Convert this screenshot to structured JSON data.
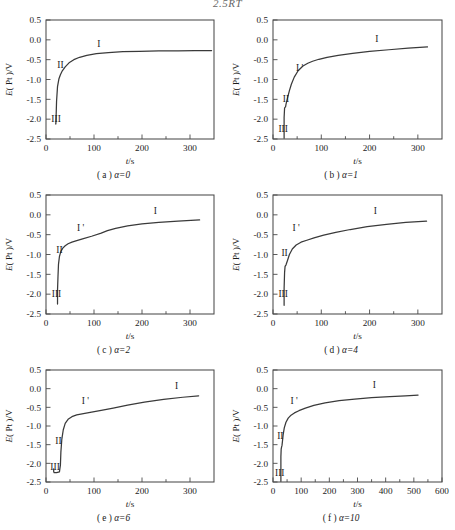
{
  "header_fragment": "2.5RT",
  "figure": {
    "y_axis_label_main": "E",
    "y_axis_label_paren": "( Pt )/V",
    "x_axis_label_main": "t",
    "x_axis_label_unit": "/s",
    "y_ticks": [
      "0.5",
      "0.0",
      "-0.5",
      "-1.0",
      "-1.5",
      "-2.0",
      "-2.5"
    ],
    "y_tick_values": [
      0.5,
      0.0,
      -0.5,
      -1.0,
      -1.5,
      -2.0,
      -2.5
    ],
    "ylim": [
      -2.5,
      0.5
    ],
    "region_labels": [
      "I",
      "I '",
      "II",
      "III"
    ],
    "curve_color": "#3a3a3a",
    "axis_color": "#4a4a4a"
  },
  "panels": [
    {
      "key": "a",
      "caption_index": "( a )",
      "caption_alpha": "α=0",
      "alpha": 0,
      "x_ticks": [
        "0",
        "100",
        "200",
        "300"
      ],
      "x_tick_values": [
        0,
        100,
        200,
        300
      ],
      "xlim": [
        0,
        350
      ],
      "x_minor_step": 50,
      "regions_shown": [
        "I",
        "II",
        "III"
      ],
      "region_positions": {
        "I": {
          "t": 110,
          "e": -0.18
        },
        "II": {
          "t": 30,
          "e": -0.72
        },
        "III": {
          "t": 21,
          "e": -2.08
        }
      },
      "chart_data": {
        "type": "line",
        "title": "( a ) α=0",
        "xlabel": "t/s",
        "ylabel": "E ( Pt )/V",
        "xlim": [
          0,
          350
        ],
        "ylim": [
          -2.5,
          0.5
        ],
        "grid": false,
        "series": [
          {
            "name": "E(Pt)",
            "x": [
              20,
              20.5,
              21,
              22,
              24,
              27,
              30,
              34,
              40,
              48,
              58,
              70,
              85,
              105,
              130,
              160,
              195,
              235,
              275,
              310,
              345
            ],
            "y": [
              -2.12,
              -2.12,
              -1.95,
              -1.55,
              -1.18,
              -0.98,
              -0.88,
              -0.78,
              -0.68,
              -0.58,
              -0.5,
              -0.44,
              -0.39,
              -0.35,
              -0.32,
              -0.3,
              -0.29,
              -0.28,
              -0.28,
              -0.27,
              -0.27
            ]
          }
        ]
      }
    },
    {
      "key": "b",
      "caption_index": "( b )",
      "caption_alpha": "α=1",
      "alpha": 1,
      "x_ticks": [
        "0",
        "100",
        "200",
        "300"
      ],
      "x_tick_values": [
        0,
        100,
        200,
        300
      ],
      "xlim": [
        0,
        350
      ],
      "x_minor_step": 50,
      "regions_shown": [
        "I",
        "I '",
        "II",
        "III"
      ],
      "region_positions": {
        "I": {
          "t": 215,
          "e": -0.06
        },
        "I '": {
          "t": 55,
          "e": -0.78
        },
        "II": {
          "t": 27,
          "e": -1.56
        },
        "III": {
          "t": 21,
          "e": -2.32
        }
      },
      "chart_data": {
        "type": "line",
        "title": "( b ) α=1",
        "xlabel": "t/s",
        "ylabel": "E ( Pt )/V",
        "xlim": [
          0,
          350
        ],
        "ylim": [
          -2.5,
          0.5
        ],
        "grid": false,
        "series": [
          {
            "name": "E(Pt)",
            "x": [
              23,
              23,
              24,
              25,
              26,
              27,
              29,
              31,
              34,
              38,
              44,
              52,
              62,
              72,
              82,
              95,
              112,
              135,
              165,
              200,
              240,
              280,
              320
            ],
            "y": [
              -2.48,
              -1.96,
              -1.72,
              -1.7,
              -1.69,
              -1.62,
              -1.52,
              -1.42,
              -1.28,
              -1.12,
              -0.94,
              -0.78,
              -0.66,
              -0.59,
              -0.54,
              -0.49,
              -0.44,
              -0.39,
              -0.34,
              -0.29,
              -0.25,
              -0.21,
              -0.18
            ]
          }
        ]
      }
    },
    {
      "key": "c",
      "caption_index": "( c )",
      "caption_alpha": "α=2",
      "alpha": 2,
      "x_ticks": [
        "0",
        "100",
        "200",
        "300"
      ],
      "x_tick_values": [
        0,
        100,
        200,
        300
      ],
      "xlim": [
        0,
        350
      ],
      "x_minor_step": 50,
      "regions_shown": [
        "I",
        "I '",
        "II",
        "III"
      ],
      "region_positions": {
        "I": {
          "t": 228,
          "e": 0.02
        },
        "I '": {
          "t": 72,
          "e": -0.42
        },
        "II": {
          "t": 28,
          "e": -0.95
        },
        "III": {
          "t": 22,
          "e": -2.08
        }
      },
      "chart_data": {
        "type": "line",
        "title": "( c ) α=2",
        "xlabel": "t/s",
        "ylabel": "E ( Pt )/V",
        "xlim": [
          0,
          350
        ],
        "ylim": [
          -2.5,
          0.5
        ],
        "grid": false,
        "series": [
          {
            "name": "E(Pt)",
            "x": [
              24,
              24,
              25,
              26,
              28,
              31,
              35,
              40,
              46,
              54,
              64,
              78,
              95,
              115,
              128,
              145,
              170,
              200,
              235,
              275,
              320
            ],
            "y": [
              -2.25,
              -1.9,
              -1.55,
              -1.25,
              -1.05,
              -0.92,
              -0.84,
              -0.78,
              -0.73,
              -0.69,
              -0.65,
              -0.6,
              -0.54,
              -0.46,
              -0.4,
              -0.34,
              -0.28,
              -0.23,
              -0.19,
              -0.16,
              -0.13
            ]
          }
        ]
      }
    },
    {
      "key": "d",
      "caption_index": "( d )",
      "caption_alpha": "α=4",
      "alpha": 4,
      "x_ticks": [
        "0",
        "100",
        "200",
        "300"
      ],
      "x_tick_values": [
        0,
        100,
        200,
        300
      ],
      "xlim": [
        0,
        350
      ],
      "x_minor_step": 50,
      "regions_shown": [
        "I",
        "I '",
        "II",
        "III"
      ],
      "region_positions": {
        "I": {
          "t": 212,
          "e": 0.02
        },
        "I '": {
          "t": 48,
          "e": -0.42
        },
        "II": {
          "t": 24,
          "e": -1.05
        },
        "III": {
          "t": 21,
          "e": -2.08
        }
      },
      "chart_data": {
        "type": "line",
        "title": "( d ) α=4",
        "xlabel": "t/s",
        "ylabel": "E ( Pt )/V",
        "xlim": [
          0,
          350
        ],
        "ylim": [
          -2.5,
          0.5
        ],
        "grid": false,
        "series": [
          {
            "name": "E(Pt)",
            "x": [
              23,
              23,
              24,
              25,
              27,
              30,
              34,
              40,
              48,
              58,
              70,
              85,
              105,
              130,
              160,
              195,
              235,
              275,
              318
            ],
            "y": [
              -2.28,
              -1.85,
              -1.45,
              -1.3,
              -1.26,
              -1.15,
              -1.0,
              -0.86,
              -0.76,
              -0.69,
              -0.64,
              -0.58,
              -0.51,
              -0.44,
              -0.37,
              -0.3,
              -0.24,
              -0.19,
              -0.16
            ]
          }
        ]
      }
    },
    {
      "key": "e",
      "caption_index": "( e )",
      "caption_alpha": "α=6",
      "alpha": 6,
      "x_ticks": [
        "0",
        "100",
        "200",
        "300"
      ],
      "x_tick_values": [
        0,
        100,
        200,
        300
      ],
      "xlim": [
        0,
        350
      ],
      "x_minor_step": 50,
      "regions_shown": [
        "I",
        "I '",
        "II",
        "III"
      ],
      "region_positions": {
        "I": {
          "t": 272,
          "e": -0.02
        },
        "I '": {
          "t": 82,
          "e": -0.42
        },
        "II": {
          "t": 26,
          "e": -1.48
        },
        "III": {
          "t": 19,
          "e": -2.18
        }
      },
      "chart_data": {
        "type": "line",
        "title": "( e ) α=6",
        "xlabel": "t/s",
        "ylabel": "E ( Pt )/V",
        "xlim": [
          0,
          350
        ],
        "ylim": [
          -2.5,
          0.5
        ],
        "grid": false,
        "series": [
          {
            "name": "E(Pt)",
            "x": [
              16,
              16,
              17,
              22,
              28,
              30,
              31,
              33,
              36,
              40,
              46,
              54,
              64,
              78,
              95,
              115,
              140,
              170,
              205,
              245,
              285,
              318
            ],
            "y": [
              -2.15,
              -2.22,
              -2.25,
              -2.25,
              -2.23,
              -2.05,
              -1.7,
              -1.35,
              -1.1,
              -0.93,
              -0.82,
              -0.75,
              -0.7,
              -0.67,
              -0.63,
              -0.58,
              -0.52,
              -0.44,
              -0.36,
              -0.29,
              -0.23,
              -0.19
            ]
          }
        ]
      }
    },
    {
      "key": "f",
      "caption_index": "( f )",
      "caption_alpha": "α=10",
      "alpha": 10,
      "x_ticks": [
        "0",
        "100",
        "200",
        "300",
        "400",
        "500",
        "600"
      ],
      "x_tick_values": [
        0,
        100,
        200,
        300,
        400,
        500,
        600
      ],
      "xlim": [
        0,
        600
      ],
      "x_minor_step": 50,
      "regions_shown": [
        "I",
        "I '",
        "II",
        "III"
      ],
      "region_positions": {
        "I": {
          "t": 360,
          "e": 0.02
        },
        "I '": {
          "t": 75,
          "e": -0.4
        },
        "II": {
          "t": 26,
          "e": -1.35
        },
        "III": {
          "t": 24,
          "e": -2.35
        }
      },
      "chart_data": {
        "type": "line",
        "title": "( f ) α=10",
        "xlabel": "t/s",
        "ylabel": "E ( Pt )/V",
        "xlim": [
          0,
          600
        ],
        "ylim": [
          -2.5,
          0.5
        ],
        "grid": false,
        "series": [
          {
            "name": "E(Pt)",
            "x": [
              28,
              28,
              29,
              30,
              32,
              34,
              36,
              40,
              46,
              54,
              64,
              76,
              92,
              115,
              145,
              185,
              235,
              290,
              350,
              415,
              470,
              515
            ],
            "y": [
              -2.48,
              -1.82,
              -1.62,
              -1.58,
              -1.52,
              -1.38,
              -1.24,
              -1.05,
              -0.9,
              -0.79,
              -0.71,
              -0.65,
              -0.59,
              -0.52,
              -0.45,
              -0.38,
              -0.32,
              -0.28,
              -0.24,
              -0.21,
              -0.19,
              -0.17
            ]
          }
        ]
      }
    }
  ]
}
